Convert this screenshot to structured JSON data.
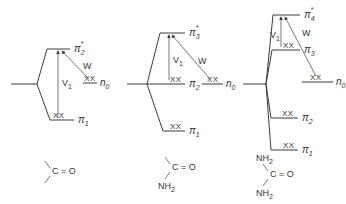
{
  "figure": {
    "colors": {
      "line": "#3a3a3a",
      "text": "#333333",
      "background": "#ffffff"
    },
    "electron_pair_mark": "XX",
    "diagrams": [
      {
        "id": "carbonyl",
        "stub": {
          "x1": 11,
          "x2": 37,
          "y": 84
        },
        "levels": [
          {
            "name": "pi2*",
            "base": "π",
            "sub": "2",
            "sup": "*",
            "x1": 47,
            "x2": 70,
            "y": 49,
            "occupied": false
          },
          {
            "name": "pi1",
            "base": "π",
            "sub": "1",
            "sup": "",
            "x1": 50,
            "x2": 74,
            "y": 120,
            "occupied": true,
            "xx_x": 53
          }
        ],
        "n0": {
          "base": "n",
          "sub": "0",
          "x1": 83,
          "x2": 97,
          "y": 83,
          "xx_x": 84
        },
        "V1": {
          "base": "V",
          "sub": "1",
          "x": 58,
          "y1": 118,
          "y2": 51,
          "label_x": 62,
          "label_y": 86
        },
        "W": {
          "label": "W",
          "x1": 89,
          "y1": 79,
          "x2": 62,
          "y2": 51,
          "label_x": 83,
          "label_y": 69
        },
        "structure": {
          "lines": [
            "C = O"
          ],
          "top_sub": "",
          "bottom_sub": "",
          "c_x": 52,
          "c_y": 174
        }
      },
      {
        "id": "amide",
        "stub": {
          "x1": 127,
          "x2": 147,
          "y": 84
        },
        "levels": [
          {
            "name": "pi3*",
            "base": "π",
            "sub": "3",
            "sup": "*",
            "x1": 160,
            "x2": 185,
            "y": 33,
            "occupied": false
          },
          {
            "name": "pi2",
            "base": "π",
            "sub": "2",
            "sup": "",
            "x1": 147,
            "x2": 185,
            "y": 84,
            "occupied": true,
            "xx_x": 170
          },
          {
            "name": "pi1",
            "base": "π",
            "sub": "1",
            "sup": "",
            "x1": 163,
            "x2": 185,
            "y": 131,
            "occupied": true,
            "xx_x": 170
          }
        ],
        "n0": {
          "base": "n",
          "sub": "0",
          "x1": 202,
          "x2": 223,
          "y": 84,
          "xx_x": 207
        },
        "V1": {
          "base": "V",
          "sub": "1",
          "x": 169,
          "y1": 80,
          "y2": 35,
          "label_x": 173,
          "label_y": 63
        },
        "W": {
          "label": "W",
          "x1": 210,
          "y1": 79,
          "x2": 172,
          "y2": 35,
          "label_x": 198,
          "label_y": 64
        },
        "structure": {
          "lines": [
            "C = O"
          ],
          "bottom_sub": "NH",
          "bottom_sub_index": "2",
          "c_x": 172,
          "c_y": 170
        }
      },
      {
        "id": "urea",
        "stub": {
          "x1": 243,
          "x2": 266,
          "y": 84
        },
        "levels": [
          {
            "name": "pi4*",
            "base": "π",
            "sub": "4",
            "sup": "*",
            "x1": 273,
            "x2": 300,
            "y": 15,
            "occupied": false
          },
          {
            "name": "pi3",
            "base": "π",
            "sub": "3",
            "sup": "",
            "x1": 272,
            "x2": 300,
            "y": 50,
            "occupied": true,
            "xx_x": 283
          },
          {
            "name": "pi2",
            "base": "π",
            "sub": "2",
            "sup": "",
            "x1": 271,
            "x2": 298,
            "y": 118,
            "occupied": true,
            "xx_x": 282
          },
          {
            "name": "pi1",
            "base": "π",
            "sub": "1",
            "sup": "",
            "x1": 271,
            "x2": 298,
            "y": 150,
            "occupied": true,
            "xx_x": 283
          }
        ],
        "n0": {
          "base": "n",
          "sub": "0",
          "x1": 302,
          "x2": 333,
          "y": 82,
          "xx_x": 310
        },
        "V1": {
          "base": "V",
          "sub": "1",
          "x": 281,
          "y1": 47,
          "y2": 17,
          "label_x": 270,
          "label_y": 38
        },
        "W": {
          "label": "W",
          "x1": 316,
          "y1": 76,
          "x2": 285,
          "y2": 17,
          "label_x": 302,
          "label_y": 36
        },
        "structure": {
          "lines": [
            "C = O"
          ],
          "top_sub": "NH",
          "top_sub_index": "2",
          "bottom_sub": "NH",
          "bottom_sub_index": "2",
          "c_x": 270,
          "c_y": 177
        }
      }
    ]
  }
}
